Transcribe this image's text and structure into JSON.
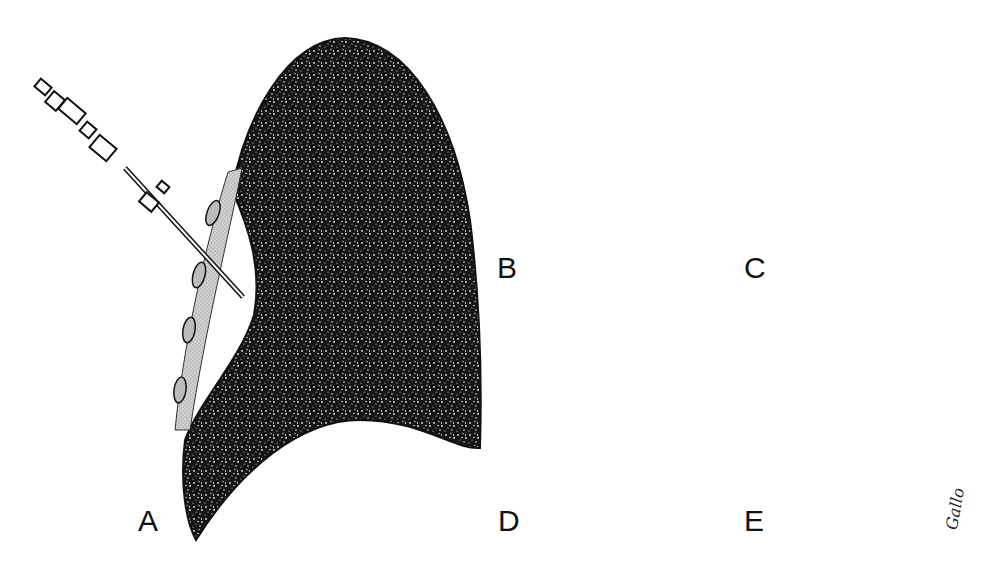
{
  "figure": {
    "type": "medical-procedure-illustration",
    "panels": [
      {
        "id": "A",
        "label": "A",
        "depicts": "needle inserted through chest wall between ribs toward lung surface"
      },
      {
        "id": "B",
        "label": "B",
        "depicts": "blunt tube advanced between ribs, tip near lung"
      },
      {
        "id": "C",
        "label": "C",
        "depicts": "cutting tip extended toward lung surface"
      },
      {
        "id": "D",
        "label": "D",
        "depicts": "tube tilted against rib, curved arrow shows rotation"
      },
      {
        "id": "E",
        "label": "E",
        "depicts": "tube advanced downward, straight arrow shows direction"
      }
    ],
    "signature": "Gallo",
    "colors": {
      "background": "#ffffff",
      "lung_fill": "#151515",
      "lung_speckle": "#e8e8e8",
      "rib_fill": "#c8c8c8",
      "rib_nucleus": "#1a1a1a",
      "outline": "#111111",
      "arrow": "#111111"
    }
  }
}
